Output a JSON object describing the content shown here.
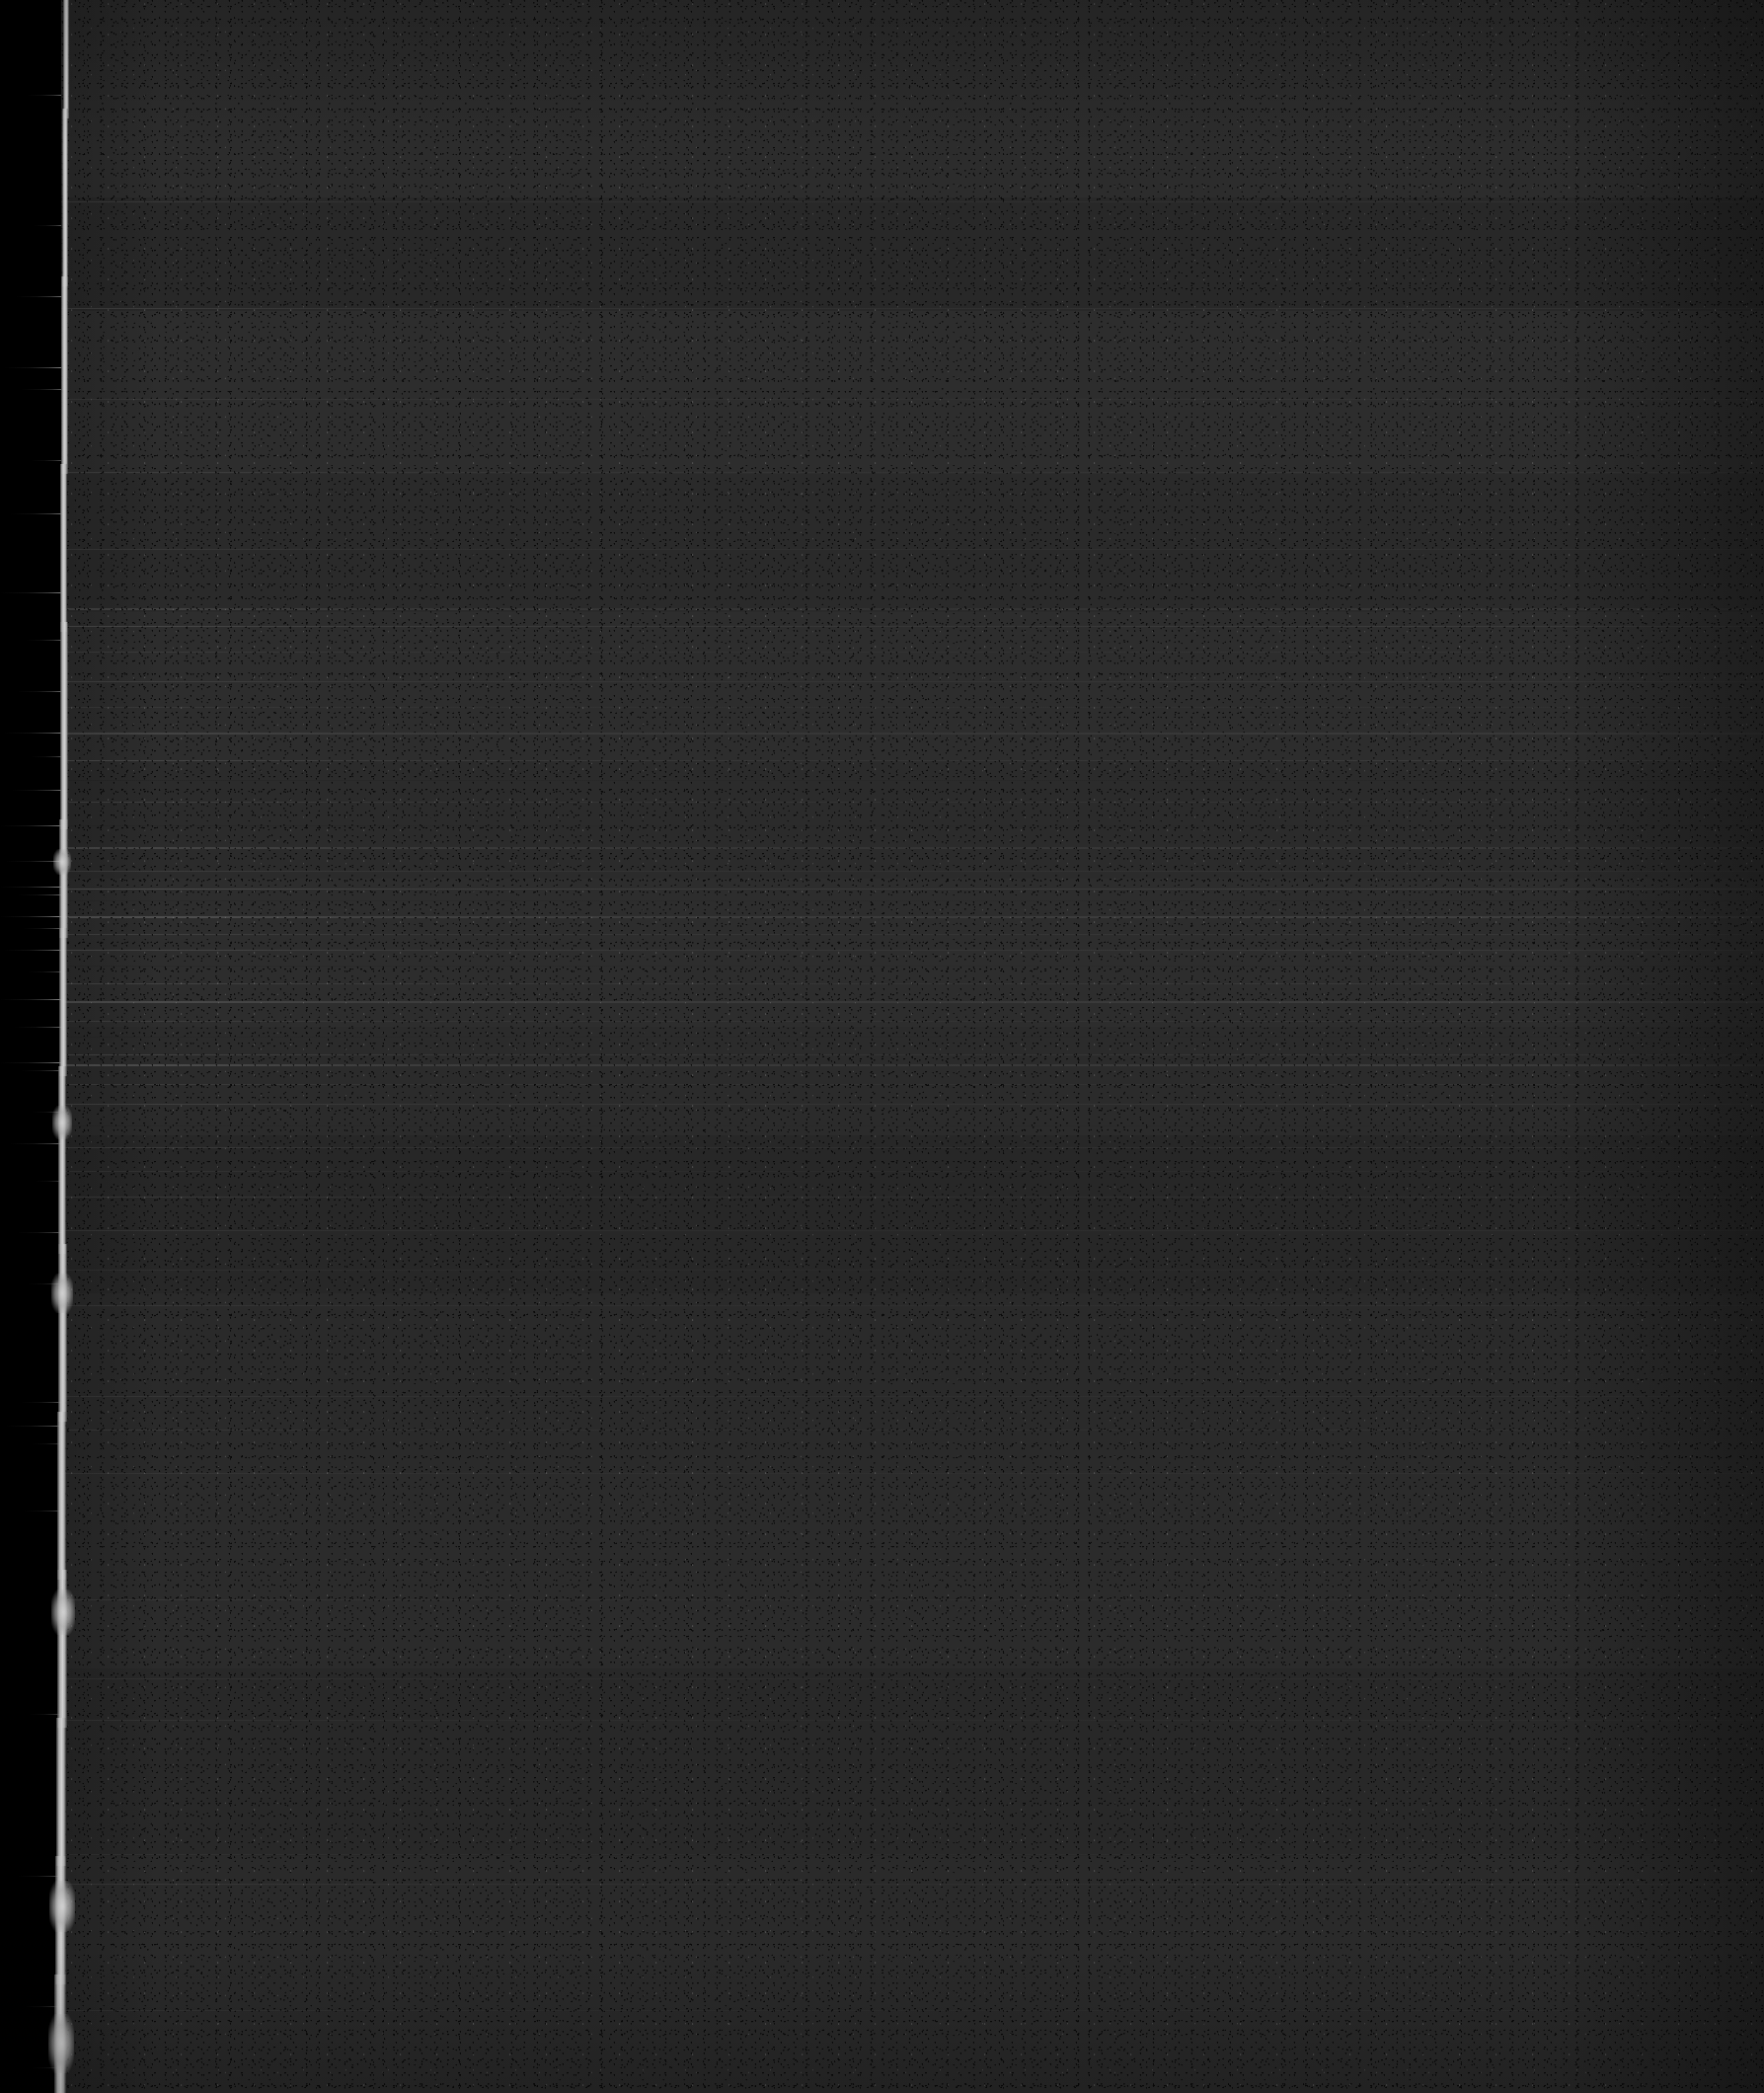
{
  "image": {
    "kind": "degraded-document-scan",
    "description": "Severely underexposed / degraded scan of a document page. No legible text is rendered in the pixels.",
    "width": 1787,
    "height": 2120,
    "legible_text": "",
    "colors": {
      "outer_black": "#000000",
      "page_body": "#2a2a2a",
      "page_body_dark": "#202020",
      "page_body_light": "#333333",
      "edge_highlight": "#ffffff",
      "streak": "#e8e8e8"
    }
  },
  "regions": {
    "left_margin": {
      "name": "left-black-margin",
      "x": 0,
      "width": 62,
      "fill": "#000000"
    },
    "page_edge": {
      "name": "bright-page-edge",
      "x": 58,
      "width": 14,
      "fill": "#ffffff"
    },
    "page_body": {
      "name": "page-body",
      "x": 62,
      "width": 1725,
      "fill": "#2a2a2a"
    }
  },
  "edge_segments": [
    {
      "top": 0,
      "height": 120,
      "left": 6,
      "width": 6
    },
    {
      "top": 110,
      "height": 180,
      "left": 5,
      "width": 6
    },
    {
      "top": 280,
      "height": 200,
      "left": 4,
      "width": 7
    },
    {
      "top": 470,
      "height": 170,
      "left": 3,
      "width": 7
    },
    {
      "top": 630,
      "height": 210,
      "left": 3,
      "width": 8
    },
    {
      "top": 830,
      "height": 120,
      "left": 2,
      "width": 9
    },
    {
      "top": 940,
      "height": 150,
      "left": 2,
      "width": 8
    },
    {
      "top": 1080,
      "height": 190,
      "left": 1,
      "width": 8
    },
    {
      "top": 1260,
      "height": 180,
      "left": 1,
      "width": 9
    },
    {
      "top": 1430,
      "height": 170,
      "left": 0,
      "width": 9
    },
    {
      "top": 1590,
      "height": 160,
      "left": 0,
      "width": 10
    },
    {
      "top": 1740,
      "height": 150,
      "left": -1,
      "width": 10
    },
    {
      "top": 1880,
      "height": 130,
      "left": -2,
      "width": 11
    },
    {
      "top": 2000,
      "height": 120,
      "left": -3,
      "width": 12
    }
  ],
  "edge_blobs": [
    {
      "top": 860,
      "left": -4,
      "width": 18,
      "height": 26
    },
    {
      "top": 1120,
      "left": -5,
      "width": 20,
      "height": 34
    },
    {
      "top": 1290,
      "left": -6,
      "width": 22,
      "height": 40
    },
    {
      "top": 1610,
      "left": -6,
      "width": 24,
      "height": 46
    },
    {
      "top": 1905,
      "left": -8,
      "width": 26,
      "height": 52
    },
    {
      "top": 2040,
      "left": -9,
      "width": 26,
      "height": 60
    }
  ],
  "leak_streaks": [
    {
      "top": 96,
      "width": 34,
      "opacity": 0.55
    },
    {
      "top": 228,
      "width": 28,
      "opacity": 0.45
    },
    {
      "top": 300,
      "width": 46,
      "opacity": 0.6
    },
    {
      "top": 372,
      "width": 58,
      "opacity": 0.72
    },
    {
      "top": 394,
      "width": 40,
      "opacity": 0.5
    },
    {
      "top": 466,
      "width": 30,
      "opacity": 0.42
    },
    {
      "top": 520,
      "width": 52,
      "opacity": 0.62
    },
    {
      "top": 600,
      "width": 62,
      "opacity": 0.7
    },
    {
      "top": 648,
      "width": 36,
      "opacity": 0.48
    },
    {
      "top": 700,
      "width": 44,
      "opacity": 0.55
    },
    {
      "top": 742,
      "width": 58,
      "opacity": 0.68
    },
    {
      "top": 766,
      "width": 30,
      "opacity": 0.44
    },
    {
      "top": 800,
      "width": 50,
      "opacity": 0.6
    },
    {
      "top": 836,
      "width": 62,
      "opacity": 0.74
    },
    {
      "top": 872,
      "width": 56,
      "opacity": 0.66
    },
    {
      "top": 898,
      "width": 62,
      "opacity": 0.8
    },
    {
      "top": 906,
      "width": 44,
      "opacity": 0.58
    },
    {
      "top": 928,
      "width": 62,
      "opacity": 0.82
    },
    {
      "top": 940,
      "width": 38,
      "opacity": 0.52
    },
    {
      "top": 962,
      "width": 58,
      "opacity": 0.7
    },
    {
      "top": 984,
      "width": 34,
      "opacity": 0.46
    },
    {
      "top": 1012,
      "width": 62,
      "opacity": 0.76
    },
    {
      "top": 1040,
      "width": 48,
      "opacity": 0.58
    },
    {
      "top": 1076,
      "width": 62,
      "opacity": 0.78
    },
    {
      "top": 1084,
      "width": 40,
      "opacity": 0.52
    },
    {
      "top": 1126,
      "width": 30,
      "opacity": 0.42
    },
    {
      "top": 1158,
      "width": 52,
      "opacity": 0.62
    },
    {
      "top": 1196,
      "width": 26,
      "opacity": 0.38
    },
    {
      "top": 1248,
      "width": 44,
      "opacity": 0.54
    },
    {
      "top": 1300,
      "width": 34,
      "opacity": 0.44
    },
    {
      "top": 1420,
      "width": 40,
      "opacity": 0.5
    },
    {
      "top": 1444,
      "width": 56,
      "opacity": 0.64
    },
    {
      "top": 1462,
      "width": 30,
      "opacity": 0.4
    },
    {
      "top": 1530,
      "width": 38,
      "opacity": 0.48
    },
    {
      "top": 1736,
      "width": 32,
      "opacity": 0.44
    },
    {
      "top": 1900,
      "width": 44,
      "opacity": 0.52
    },
    {
      "top": 2032,
      "width": 36,
      "opacity": 0.46
    },
    {
      "top": 2094,
      "width": 30,
      "opacity": 0.4
    }
  ],
  "tone_bands": [
    {
      "top": 0,
      "height": 200,
      "color": "#2e2e2e",
      "opacity": 0.55
    },
    {
      "top": 200,
      "height": 115,
      "color": "#262626",
      "opacity": 0.5
    },
    {
      "top": 315,
      "height": 165,
      "color": "#303030",
      "opacity": 0.45
    },
    {
      "top": 480,
      "height": 140,
      "color": "#2b2b2b",
      "opacity": 0.4
    },
    {
      "top": 620,
      "height": 150,
      "color": "#333333",
      "opacity": 0.42
    },
    {
      "top": 770,
      "height": 120,
      "color": "#2d2d2d",
      "opacity": 0.38
    },
    {
      "top": 890,
      "height": 150,
      "color": "#323232",
      "opacity": 0.46
    },
    {
      "top": 1040,
      "height": 110,
      "color": "#2c2c2c",
      "opacity": 0.4
    },
    {
      "top": 1150,
      "height": 160,
      "color": "#262626",
      "opacity": 0.48
    },
    {
      "top": 1310,
      "height": 180,
      "color": "#2a2a2a",
      "opacity": 0.35
    },
    {
      "top": 1490,
      "height": 200,
      "color": "#2d2d2d",
      "opacity": 0.38
    },
    {
      "top": 1690,
      "height": 190,
      "color": "#272727",
      "opacity": 0.42
    },
    {
      "top": 1880,
      "height": 240,
      "color": "#2b2b2b",
      "opacity": 0.36
    }
  ],
  "scanlines": [
    {
      "top": 204,
      "h": 1,
      "opacity": 0.1,
      "tint": "light"
    },
    {
      "top": 312,
      "h": 1,
      "opacity": 0.12,
      "tint": "light"
    },
    {
      "top": 404,
      "h": 1,
      "opacity": 0.07,
      "tint": "light"
    },
    {
      "top": 478,
      "h": 1,
      "opacity": 0.11,
      "tint": "light"
    },
    {
      "top": 556,
      "h": 1,
      "opacity": 0.08,
      "tint": "light"
    },
    {
      "top": 616,
      "h": 2,
      "opacity": 0.14,
      "tint": "light"
    },
    {
      "top": 634,
      "h": 1,
      "opacity": 0.16,
      "tint": "light"
    },
    {
      "top": 660,
      "h": 1,
      "opacity": 0.09,
      "tint": "light"
    },
    {
      "top": 690,
      "h": 1,
      "opacity": 0.12,
      "tint": "light"
    },
    {
      "top": 716,
      "h": 1,
      "opacity": 0.07,
      "tint": "light"
    },
    {
      "top": 742,
      "h": 2,
      "opacity": 0.15,
      "tint": "light"
    },
    {
      "top": 770,
      "h": 1,
      "opacity": 0.18,
      "tint": "light"
    },
    {
      "top": 790,
      "h": 1,
      "opacity": 0.1,
      "tint": "dark"
    },
    {
      "top": 812,
      "h": 1,
      "opacity": 0.13,
      "tint": "light"
    },
    {
      "top": 836,
      "h": 1,
      "opacity": 0.09,
      "tint": "dark"
    },
    {
      "top": 858,
      "h": 2,
      "opacity": 0.17,
      "tint": "light"
    },
    {
      "top": 882,
      "h": 1,
      "opacity": 0.11,
      "tint": "light"
    },
    {
      "top": 900,
      "h": 1,
      "opacity": 0.2,
      "tint": "light"
    },
    {
      "top": 912,
      "h": 1,
      "opacity": 0.1,
      "tint": "dark"
    },
    {
      "top": 928,
      "h": 2,
      "opacity": 0.22,
      "tint": "light"
    },
    {
      "top": 946,
      "h": 1,
      "opacity": 0.12,
      "tint": "light"
    },
    {
      "top": 962,
      "h": 1,
      "opacity": 0.16,
      "tint": "light"
    },
    {
      "top": 978,
      "h": 1,
      "opacity": 0.09,
      "tint": "dark"
    },
    {
      "top": 996,
      "h": 1,
      "opacity": 0.14,
      "tint": "light"
    },
    {
      "top": 1014,
      "h": 2,
      "opacity": 0.19,
      "tint": "light"
    },
    {
      "top": 1034,
      "h": 1,
      "opacity": 0.11,
      "tint": "light"
    },
    {
      "top": 1050,
      "h": 1,
      "opacity": 0.08,
      "tint": "dark"
    },
    {
      "top": 1068,
      "h": 1,
      "opacity": 0.15,
      "tint": "light"
    },
    {
      "top": 1078,
      "h": 2,
      "opacity": 0.21,
      "tint": "light"
    },
    {
      "top": 1098,
      "h": 1,
      "opacity": 0.1,
      "tint": "light"
    },
    {
      "top": 1118,
      "h": 1,
      "opacity": 0.13,
      "tint": "light"
    },
    {
      "top": 1140,
      "h": 1,
      "opacity": 0.08,
      "tint": "dark"
    },
    {
      "top": 1162,
      "h": 1,
      "opacity": 0.12,
      "tint": "light"
    },
    {
      "top": 1186,
      "h": 1,
      "opacity": 0.07,
      "tint": "light"
    },
    {
      "top": 1212,
      "h": 1,
      "opacity": 0.1,
      "tint": "light"
    },
    {
      "top": 1246,
      "h": 1,
      "opacity": 0.09,
      "tint": "light"
    },
    {
      "top": 1286,
      "h": 1,
      "opacity": 0.06,
      "tint": "light"
    },
    {
      "top": 1322,
      "h": 1,
      "opacity": 0.08,
      "tint": "light"
    },
    {
      "top": 1414,
      "h": 1,
      "opacity": 0.07,
      "tint": "light"
    },
    {
      "top": 1448,
      "h": 1,
      "opacity": 0.09,
      "tint": "light"
    },
    {
      "top": 1492,
      "h": 1,
      "opacity": 0.06,
      "tint": "light"
    },
    {
      "top": 1620,
      "h": 1,
      "opacity": 0.08,
      "tint": "light"
    },
    {
      "top": 1700,
      "h": 1,
      "opacity": 0.06,
      "tint": "light"
    },
    {
      "top": 1742,
      "h": 1,
      "opacity": 0.07,
      "tint": "light"
    },
    {
      "top": 1878,
      "h": 1,
      "opacity": 0.06,
      "tint": "light"
    },
    {
      "top": 1908,
      "h": 1,
      "opacity": 0.08,
      "tint": "light"
    },
    {
      "top": 2036,
      "h": 1,
      "opacity": 0.06,
      "tint": "light"
    }
  ]
}
